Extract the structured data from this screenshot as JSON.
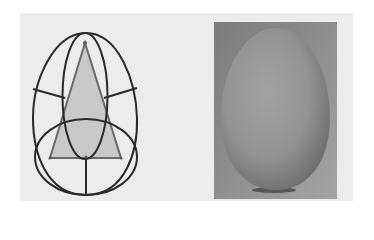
{
  "figure": {
    "left_panel": {
      "label": "Egg construction diagram",
      "elements": [
        "egg-outline",
        "triangle",
        "tall-ellipse",
        "bottom-ellipse",
        "construction-lines"
      ]
    },
    "right_panel": {
      "label": "Photograph of an egg"
    },
    "colors": {
      "stroke": "#2a2a2a",
      "triangle_fill": "#c9c9c9",
      "background": "#ececec",
      "photo_bg": "#8f8f8f",
      "egg_tone": "#9a9a9a"
    }
  }
}
